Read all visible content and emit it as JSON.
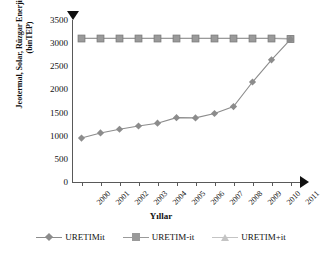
{
  "chart_data": {
    "type": "line",
    "title": "",
    "xlabel": "Yıllar",
    "ylabel": "Jeotermal, Solar, Rüzgar Enerjisi Üretimi\n(binTEP)",
    "categories": [
      "2000",
      "2001",
      "2002",
      "2003",
      "2004",
      "2005",
      "2006",
      "2007",
      "2008",
      "2009",
      "2010",
      "2011"
    ],
    "ylim": [
      0,
      3500
    ],
    "yticks": [
      0,
      500,
      1000,
      1500,
      2000,
      2500,
      3000,
      3500
    ],
    "ytick_labels": [
      "0",
      "500",
      "1000",
      "1500",
      "2000",
      "2500",
      "3000",
      "3500"
    ],
    "grid": false,
    "legend_position": "bottom",
    "series": [
      {
        "name": "URETIMit",
        "marker": "diamond",
        "color": "#8c8c8c",
        "values": [
          950,
          1060,
          1140,
          1210,
          1270,
          1390,
          1385,
          1480,
          1630,
          2160,
          2640,
          3080
        ]
      },
      {
        "name": "URETIM-it",
        "marker": "square",
        "color": "#9a9a9a",
        "values": [
          3100,
          3100,
          3100,
          3100,
          3100,
          3100,
          3100,
          3100,
          3100,
          3100,
          3100,
          3090
        ]
      },
      {
        "name": "URETIM+it",
        "marker": "triangle",
        "color": "#c4c4c4",
        "values": [
          3110,
          3110,
          3110,
          3110,
          3110,
          3110,
          3110,
          3110,
          3110,
          3110,
          3110,
          3100
        ]
      }
    ],
    "axis_arrow_top": true,
    "axis_arrow_right": true
  },
  "axes": {
    "y_title": "Jeotermal, Solar, Rüzgar Enerjisi Üretimi\n(binTEP)",
    "x_title": "Yıllar"
  },
  "legend": {
    "items": [
      {
        "label": "URETIMit"
      },
      {
        "label": "URETIM-it"
      },
      {
        "label": "URETIM+it"
      }
    ]
  },
  "colors": {
    "axis": "#595959",
    "series1": "#8c8c8c",
    "series2": "#9a9a9a",
    "series3": "#c4c4c4",
    "text": "#111111",
    "background": "#ffffff"
  }
}
